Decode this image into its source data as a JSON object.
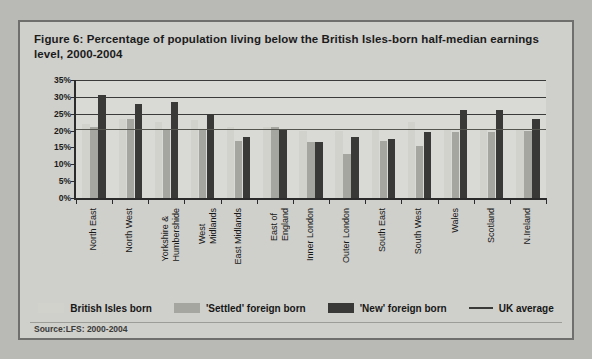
{
  "figure": {
    "title": "Figure 6: Percentage of population living below the British Isles-born half-median earnings level, 2000-2004",
    "source": "Source:LFS: 2000-2004"
  },
  "legend": {
    "items": [
      {
        "label": "British Isles born",
        "color": "#d2d2cd",
        "kind": "swatch"
      },
      {
        "label": "'Settled' foreign born",
        "color": "#a6a6a0",
        "kind": "swatch"
      },
      {
        "label": "'New' foreign born",
        "color": "#393937",
        "kind": "swatch"
      },
      {
        "label": "UK average",
        "color": "#3a3a38",
        "kind": "line"
      }
    ]
  },
  "chart_data": {
    "type": "bar",
    "title": "Figure 6: Percentage of population living below the British Isles-born half-median earnings level, 2000-2004",
    "xlabel": "",
    "ylabel": "",
    "ylim": [
      0,
      35
    ],
    "ytick_labels": [
      "0%",
      "5%",
      "10%",
      "15%",
      "20%",
      "25%",
      "30%",
      "35%"
    ],
    "ytick_values": [
      0,
      5,
      10,
      15,
      20,
      25,
      30,
      35
    ],
    "grid": true,
    "legend_position": "bottom",
    "categories": [
      "North East",
      "North West",
      "Yorkshire &\nHumbershide",
      "West\nMidlands",
      "East Midlands",
      "East of\nEngland",
      "Inner London",
      "Outer London",
      "South East",
      "South West",
      "Wales",
      "Scotland",
      "N.Ireland"
    ],
    "series": [
      {
        "name": "British Isles born",
        "color": "#d2d2cd",
        "values": [
          22.0,
          23.5,
          22.5,
          23.0,
          21.0,
          21.0,
          20.0,
          20.0,
          20.5,
          22.5,
          20.5,
          20.5,
          20.5
        ]
      },
      {
        "name": "'Settled' foreign born",
        "color": "#a6a6a0",
        "values": [
          21.0,
          23.5,
          20.5,
          20.5,
          17.0,
          21.0,
          16.5,
          13.0,
          17.0,
          15.5,
          19.5,
          19.5,
          20.0
        ]
      },
      {
        "name": "'New' foreign born",
        "color": "#393937",
        "values": [
          30.5,
          28.0,
          28.5,
          25.0,
          18.0,
          20.5,
          16.5,
          18.0,
          17.5,
          19.5,
          26.0,
          26.0,
          23.5
        ]
      }
    ],
    "reference_line": {
      "name": "UK average",
      "value": 20.5,
      "color": "#55554f"
    }
  }
}
